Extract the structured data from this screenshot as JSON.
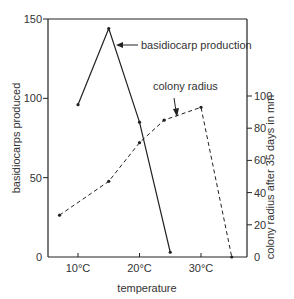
{
  "chart_data": {
    "type": "line",
    "title": "",
    "xlabel": "temperature",
    "ylabel": "basidiocarps produced",
    "y2label": "colony radius after 35 days in mm",
    "xlim": [
      5,
      37
    ],
    "ylim": [
      0,
      150
    ],
    "y2lim": [
      0,
      125
    ],
    "x_ticks": [
      {
        "value": 10,
        "label": "10°C"
      },
      {
        "value": 20,
        "label": "20°C"
      },
      {
        "value": 30,
        "label": "30°C"
      }
    ],
    "y_ticks": [
      {
        "value": 0,
        "label": "0"
      },
      {
        "value": 50,
        "label": "50"
      },
      {
        "value": 100,
        "label": "100"
      },
      {
        "value": 150,
        "label": "150"
      }
    ],
    "y2_ticks": [
      {
        "value": 0,
        "label": "0"
      },
      {
        "value": 20,
        "label": "20"
      },
      {
        "value": 40,
        "label": "40"
      },
      {
        "value": 60,
        "label": "60"
      },
      {
        "value": 80,
        "label": "80"
      },
      {
        "value": 100,
        "label": "100"
      }
    ],
    "grid": false,
    "legend": "none (inline annotations)",
    "series": [
      {
        "name": "basidiocarp production",
        "axis": "left",
        "style": "solid",
        "x": [
          10,
          15,
          20,
          25
        ],
        "values": [
          96,
          144,
          85,
          3
        ]
      },
      {
        "name": "colony radius",
        "axis": "right",
        "style": "dashed",
        "x": [
          7,
          15,
          20,
          24,
          30,
          35
        ],
        "values": [
          26,
          47,
          71,
          85,
          93,
          0
        ]
      }
    ],
    "annotations": [
      {
        "text": "basidiocarp production",
        "points_to": "basidiocarp production series, arrow left"
      },
      {
        "text": "colony radius",
        "points_to": "colony radius series, arrow down"
      }
    ]
  },
  "colors": {
    "line": "#222222",
    "background": "#ffffff"
  }
}
